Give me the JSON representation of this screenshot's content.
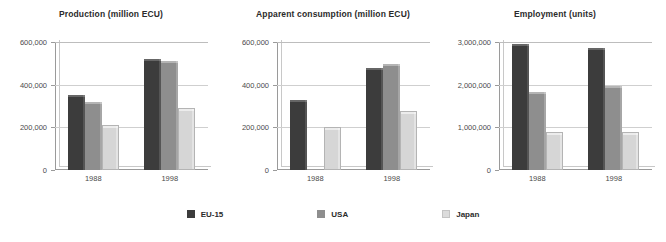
{
  "legend": {
    "position": "bottom-center",
    "entries": [
      {
        "name": "EU-15",
        "color": "#3c3c3c",
        "swatch": "eu"
      },
      {
        "name": "USA",
        "color": "#8e8e8e",
        "swatch": "usa"
      },
      {
        "name": "Japan",
        "color": "#dcdcdc",
        "swatch": "jp"
      }
    ]
  },
  "chart_data": [
    {
      "type": "bar",
      "title": "Production (million ECU)",
      "xlabel": "",
      "ylabel": "",
      "categories": [
        "1988",
        "1998"
      ],
      "ylim": [
        0,
        600000
      ],
      "yticks": [
        0,
        200000,
        400000,
        600000
      ],
      "ytick_labels": [
        "0",
        "200,000",
        "400,000",
        "600,000"
      ],
      "grid": true,
      "series": [
        {
          "name": "EU-15",
          "values": [
            352000,
            522000
          ]
        },
        {
          "name": "USA",
          "values": [
            320000,
            512000
          ]
        },
        {
          "name": "Japan",
          "values": [
            210000,
            292000
          ]
        }
      ]
    },
    {
      "type": "bar",
      "title": "Apparent consumption (million ECU)",
      "xlabel": "",
      "ylabel": "",
      "categories": [
        "1988",
        "1998"
      ],
      "ylim": [
        0,
        600000
      ],
      "yticks": [
        0,
        200000,
        400000,
        600000
      ],
      "ytick_labels": [
        "0",
        "200,000",
        "400,000",
        "600,000"
      ],
      "grid": true,
      "series": [
        {
          "name": "EU-15",
          "values": [
            330000,
            478000
          ]
        },
        {
          "name": "USA",
          "values": [
            0,
            498000
          ]
        },
        {
          "name": "Japan",
          "values": [
            202000,
            278000
          ]
        }
      ]
    },
    {
      "type": "bar",
      "title": "Employment (units)",
      "xlabel": "",
      "ylabel": "",
      "categories": [
        "1988",
        "1998"
      ],
      "ylim": [
        0,
        3000000
      ],
      "yticks": [
        0,
        1000000,
        2000000,
        3000000
      ],
      "ytick_labels": [
        "0",
        "1,000,000",
        "2,000,000",
        "3,000,000"
      ],
      "grid": true,
      "series": [
        {
          "name": "EU-15",
          "values": [
            2960000,
            2860000
          ]
        },
        {
          "name": "USA",
          "values": [
            1820000,
            1980000
          ]
        },
        {
          "name": "Japan",
          "values": [
            900000,
            900000
          ]
        }
      ]
    }
  ]
}
